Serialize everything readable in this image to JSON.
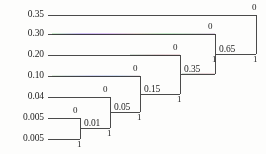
{
  "diagram": {
    "type": "huffman-coding-tree",
    "leaves": [
      {
        "id": "leaf-0",
        "probability": "0.35",
        "y": 15
      },
      {
        "id": "leaf-1",
        "probability": "0.30",
        "y": 34
      },
      {
        "id": "leaf-2",
        "probability": "0.20",
        "y": 55
      },
      {
        "id": "leaf-3",
        "probability": "0.10",
        "y": 76
      },
      {
        "id": "leaf-4",
        "probability": "0.04",
        "y": 97
      },
      {
        "id": "leaf-5",
        "probability": "0.005",
        "y": 118
      },
      {
        "id": "leaf-6",
        "probability": "0.005",
        "y": 139
      }
    ],
    "merges": [
      {
        "id": "merge-0.01",
        "label": "0.01",
        "x": 80,
        "top_y": 118,
        "bottom_y": 139,
        "out_y": 128,
        "bit_top": "0",
        "bit_bottom": "1"
      },
      {
        "id": "merge-0.05",
        "label": "0.05",
        "x": 110,
        "top_y": 97,
        "bottom_y": 128,
        "out_y": 112,
        "bit_top": "0",
        "bit_bottom": "1"
      },
      {
        "id": "merge-0.15",
        "label": "0.15",
        "x": 140,
        "top_y": 76,
        "bottom_y": 112,
        "out_y": 94,
        "bit_top": "0",
        "bit_bottom": "1"
      },
      {
        "id": "merge-0.35",
        "label": "0.35",
        "x": 180,
        "top_y": 55,
        "bottom_y": 94,
        "out_y": 74,
        "bit_top": "0",
        "bit_bottom": "1"
      },
      {
        "id": "merge-0.65",
        "label": "0.65",
        "x": 215,
        "top_y": 34,
        "bottom_y": 74,
        "out_y": 54,
        "bit_top": "0",
        "bit_bottom": "1"
      },
      {
        "id": "merge-root",
        "label": "",
        "x": 256,
        "top_y": 15,
        "bottom_y": 54,
        "out_y": 34,
        "bit_top": "0",
        "bit_bottom": "1"
      }
    ],
    "bits": {
      "zero": "0",
      "one": "1"
    },
    "merge_labels": {
      "m1": "0.01",
      "m2": "0.05",
      "m3": "0.15",
      "m4": "0.35",
      "m5": "0.65"
    },
    "root_bits": {
      "top": "0",
      "bottom": "1"
    },
    "colors": {
      "line": "#4a4a4a",
      "text": "#1c1c1c",
      "background": "#fdfdfc"
    }
  }
}
